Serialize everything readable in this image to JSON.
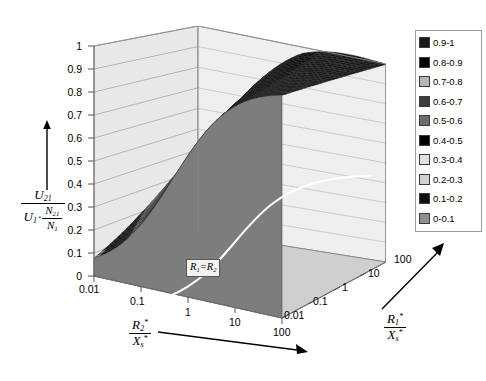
{
  "chart_data": {
    "type": "surface",
    "title": "",
    "zlabel": "U21 / (U1 * N21/N1)",
    "xlabel": "R2*/Xs*",
    "ylabel": "R1*/Xs*",
    "zlim": [
      0,
      1
    ],
    "z_ticks": [
      "1",
      "0.9",
      "0.8",
      "0.7",
      "0.6",
      "0.5",
      "0.4",
      "0.3",
      "0.2",
      "0.1",
      "0"
    ],
    "x_ticks": [
      "0.01",
      "0.1",
      "1",
      "10",
      "100"
    ],
    "y_ticks": [
      "0.01",
      "0.1",
      "1",
      "10",
      "100"
    ],
    "x_scale": "log",
    "y_scale": "log",
    "grid": true,
    "legend_position": "right",
    "annotations": [
      {
        "text": "R1=R2",
        "note": "white ridge curve across the surface"
      }
    ],
    "bands": [
      {
        "label": "0.9-1",
        "range": [
          0.9,
          1.0
        ],
        "color": "#1a1a1a"
      },
      {
        "label": "0.8-0.9",
        "range": [
          0.8,
          0.9
        ],
        "color": "#000000"
      },
      {
        "label": "0.7-0.8",
        "range": [
          0.7,
          0.8
        ],
        "color": "#b5b5b5"
      },
      {
        "label": "0.6-0.7",
        "range": [
          0.6,
          0.7
        ],
        "color": "#3d3d3d"
      },
      {
        "label": "0.5-0.6",
        "range": [
          0.5,
          0.6
        ],
        "color": "#6e6e6e"
      },
      {
        "label": "0.4-0.5",
        "range": [
          0.4,
          0.5
        ],
        "color": "#000000"
      },
      {
        "label": "0.3-0.4",
        "range": [
          0.3,
          0.4
        ],
        "color": "#e2e2e2"
      },
      {
        "label": "0.2-0.3",
        "range": [
          0.2,
          0.3
        ],
        "color": "#d0d0d0"
      },
      {
        "label": "0.1-0.2",
        "range": [
          0.1,
          0.2
        ],
        "color": "#0d0d0d"
      },
      {
        "label": "0-0.1",
        "range": [
          0.0,
          0.1
        ],
        "color": "#8f8f8f"
      }
    ],
    "surface_description": "Monotonic rising surface: near 0 at front-left (small R2*/Xs*), plateau near 1 at the back-right, separated by horizontal contour bands."
  },
  "axes": {
    "z": {
      "ticks": [
        "1",
        "0.9",
        "0.8",
        "0.7",
        "0.6",
        "0.5",
        "0.4",
        "0.3",
        "0.2",
        "0.1",
        "0"
      ],
      "title": {
        "numerator_sym": "U",
        "numerator_sub": "21",
        "den_first_sym": "U",
        "den_first_sub": "1",
        "den_dot": "·",
        "den_frac_num_sym": "N",
        "den_frac_num_sub": "21",
        "den_frac_den_sym": "N",
        "den_frac_den_sub": "1"
      }
    },
    "x": {
      "ticks": [
        "0.01",
        "0.1",
        "1",
        "10",
        "100"
      ],
      "title": {
        "num_sym": "R",
        "num_sub": "2",
        "num_sup": "*",
        "den_sym": "X",
        "den_sub": "s",
        "den_sup": "*"
      }
    },
    "y": {
      "ticks": [
        "0.01",
        "0.1",
        "1",
        "10",
        "100"
      ],
      "title": {
        "num_sym": "R",
        "num_sub": "1",
        "num_sup": "*",
        "den_sym": "X",
        "den_sub": "s",
        "den_sup": "*"
      }
    }
  },
  "annotation": {
    "ridge_sym_a": "R",
    "ridge_sub_a": "1",
    "ridge_eq": "=",
    "ridge_sym_b": "R",
    "ridge_sub_b": "2"
  },
  "legend": {
    "items": [
      {
        "label": "0.9-1",
        "color": "#1a1a1a"
      },
      {
        "label": "0.8-0.9",
        "color": "#000000"
      },
      {
        "label": "0.7-0.8",
        "color": "#b5b5b5"
      },
      {
        "label": "0.6-0.7",
        "color": "#3d3d3d"
      },
      {
        "label": "0.5-0.6",
        "color": "#6e6e6e"
      },
      {
        "label": "0.4-0.5",
        "color": "#000000"
      },
      {
        "label": "0.3-0.4",
        "color": "#e2e2e2"
      },
      {
        "label": "0.2-0.3",
        "color": "#d0d0d0"
      },
      {
        "label": "0.1-0.2",
        "color": "#0d0d0d"
      },
      {
        "label": "0-0.1",
        "color": "#8f8f8f"
      }
    ]
  },
  "caption": {
    "text": ""
  }
}
